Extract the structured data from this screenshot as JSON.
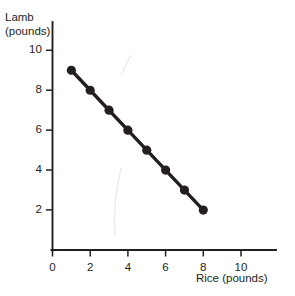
{
  "chart_data": {
    "type": "line",
    "title": "",
    "subtitle": "",
    "xlabel": "Rice (pounds)",
    "ylabel_line1": "Lamb",
    "ylabel_line2": "(pounds)",
    "ylabel": "Lamb (pounds)",
    "x": [
      1,
      2,
      3,
      4,
      5,
      6,
      7,
      8
    ],
    "values": [
      9,
      8,
      7,
      6,
      5,
      4,
      3,
      2
    ],
    "series": [
      {
        "name": "Budget constraint",
        "x": [
          1,
          2,
          3,
          4,
          5,
          6,
          7,
          8
        ],
        "values": [
          9,
          8,
          7,
          6,
          5,
          4,
          3,
          2
        ]
      }
    ],
    "xlim": [
      0,
      11.2
    ],
    "ylim": [
      0,
      11.2
    ],
    "xticks": [
      0,
      2,
      4,
      6,
      8,
      10
    ],
    "yticks": [
      2,
      4,
      6,
      8,
      10
    ],
    "xtick_labels": [
      "0",
      "2",
      "4",
      "6",
      "8",
      "10"
    ],
    "ytick_labels": [
      "2",
      "4",
      "6",
      "8",
      "10"
    ],
    "grid": false,
    "legend": false,
    "legend_position": "none",
    "marker": "circle",
    "line_color": "#231f20",
    "marker_color": "#231f20",
    "background_color": "#ffffff",
    "annotations": []
  },
  "axes": {
    "x_axis_name": "Rice (pounds)",
    "y_axis_name": "Lamb (pounds)"
  }
}
